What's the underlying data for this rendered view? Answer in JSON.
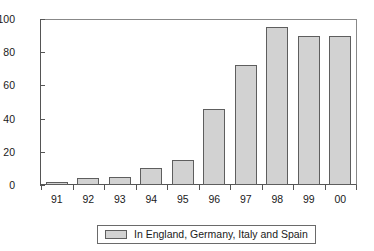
{
  "chart_data": {
    "type": "bar",
    "title": "",
    "xlabel": "",
    "ylabel": "",
    "categories": [
      "91",
      "92",
      "93",
      "94",
      "95",
      "96",
      "97",
      "98",
      "99",
      "00"
    ],
    "values": [
      2,
      4,
      5,
      10,
      15,
      46,
      72,
      95,
      90,
      90
    ],
    "series": [
      {
        "name": "In England, Germany, Italy and Spain",
        "values": [
          2,
          4,
          5,
          10,
          15,
          46,
          72,
          95,
          90,
          90
        ]
      }
    ],
    "ylim": [
      0,
      100
    ],
    "y_ticks": [
      0,
      20,
      40,
      60,
      80,
      100
    ],
    "y_tick_labels": [
      "0",
      "20",
      "40",
      "60",
      "80",
      "100"
    ],
    "grid": false,
    "legend_position": "bottom",
    "legend_entries": [
      {
        "label": "In England, Germany, Italy and Spain",
        "color": "#d2d2d2"
      }
    ],
    "colors": {
      "bar_fill": "#d2d2d2",
      "bar_border": "#5e5e5e",
      "axis": "#555555",
      "text": "#1a1a1a",
      "background": "#ffffff"
    }
  }
}
